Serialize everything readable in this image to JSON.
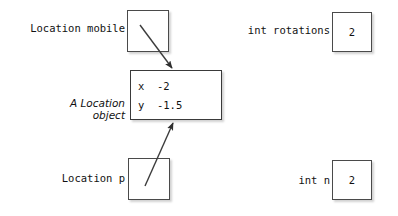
{
  "diagram": {
    "colors": {
      "box_border": "#4a4a4a",
      "text": "#111111",
      "arrow": "#3c3c3c",
      "background": "#ffffff"
    },
    "variables": [
      {
        "id": "mobile",
        "declaration": "Location mobile",
        "value": "",
        "kind": "reference"
      },
      {
        "id": "rotations",
        "declaration": "int rotations",
        "value": "2",
        "kind": "primitive"
      },
      {
        "id": "p",
        "declaration": "Location p",
        "value": "",
        "kind": "reference"
      },
      {
        "id": "n",
        "declaration": "int n",
        "value": "2",
        "kind": "primitive"
      }
    ],
    "object": {
      "caption_line1": "A Location",
      "caption_line2": "object",
      "fields": [
        {
          "name": "x",
          "value": "-2",
          "text": "x  -2"
        },
        {
          "name": "y",
          "value": "-1.5",
          "text": "y  -1.5"
        }
      ]
    },
    "arrows": [
      {
        "id": "mobile-to-object",
        "from": "mobile",
        "to": "object-top"
      },
      {
        "id": "p-to-object",
        "from": "p",
        "to": "object-bottom"
      }
    ]
  }
}
